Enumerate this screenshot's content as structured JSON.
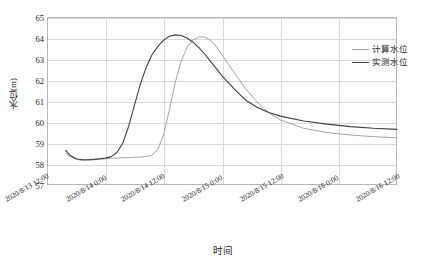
{
  "chart_data": {
    "type": "line",
    "title": "",
    "xlabel": "时间",
    "ylabel": "水位(m)",
    "ylim": [
      57,
      65
    ],
    "yticks": [
      57,
      58,
      59,
      60,
      61,
      62,
      63,
      64,
      65
    ],
    "xticks": [
      "2020/8/13 12:00",
      "2020/8/14 0:00",
      "2020/8/14 12:00",
      "2020/8/15 0:00",
      "2020/8/15 12:00",
      "2020/8/16 0:00",
      "2020/8/16 12:00"
    ],
    "grid": true,
    "legend_position": "right",
    "series": [
      {
        "name": "计算水位",
        "color": "#9a9a9a",
        "x": [
          0.16,
          0.2,
          0.25,
          0.3,
          0.35,
          0.4,
          0.45,
          0.5,
          0.55,
          0.6,
          0.65,
          0.7,
          0.75,
          0.8,
          0.85,
          0.9,
          0.95,
          1.0,
          1.05,
          1.1,
          1.15,
          1.2,
          1.25,
          1.3,
          1.35,
          1.4,
          1.45,
          1.5,
          1.6,
          1.7,
          1.8,
          1.9,
          2.0,
          2.2,
          2.4,
          2.6,
          2.8,
          3.0
        ],
        "y": [
          58.5,
          58.35,
          58.22,
          58.18,
          58.18,
          58.2,
          58.22,
          58.25,
          58.27,
          58.28,
          58.3,
          58.3,
          58.32,
          58.33,
          58.35,
          58.42,
          58.7,
          59.4,
          60.6,
          61.9,
          62.9,
          63.55,
          63.9,
          64.05,
          64.05,
          63.9,
          63.6,
          63.2,
          62.4,
          61.6,
          60.95,
          60.45,
          60.1,
          59.7,
          59.5,
          59.38,
          59.3,
          59.25
        ]
      },
      {
        "name": "实测水位",
        "color": "#404040",
        "x": [
          0.16,
          0.2,
          0.25,
          0.3,
          0.35,
          0.4,
          0.45,
          0.5,
          0.55,
          0.6,
          0.65,
          0.7,
          0.75,
          0.8,
          0.85,
          0.9,
          0.95,
          1.0,
          1.05,
          1.1,
          1.15,
          1.2,
          1.25,
          1.3,
          1.35,
          1.4,
          1.45,
          1.5,
          1.6,
          1.7,
          1.8,
          1.9,
          2.0,
          2.2,
          2.4,
          2.6,
          2.8,
          3.0
        ],
        "y": [
          58.65,
          58.4,
          58.25,
          58.2,
          58.2,
          58.22,
          58.25,
          58.28,
          58.35,
          58.55,
          59.0,
          59.8,
          60.8,
          61.8,
          62.6,
          63.2,
          63.6,
          63.9,
          64.08,
          64.15,
          64.12,
          64.0,
          63.8,
          63.55,
          63.25,
          62.9,
          62.55,
          62.2,
          61.6,
          61.05,
          60.7,
          60.45,
          60.28,
          60.05,
          59.9,
          59.78,
          59.7,
          59.65
        ]
      }
    ]
  }
}
